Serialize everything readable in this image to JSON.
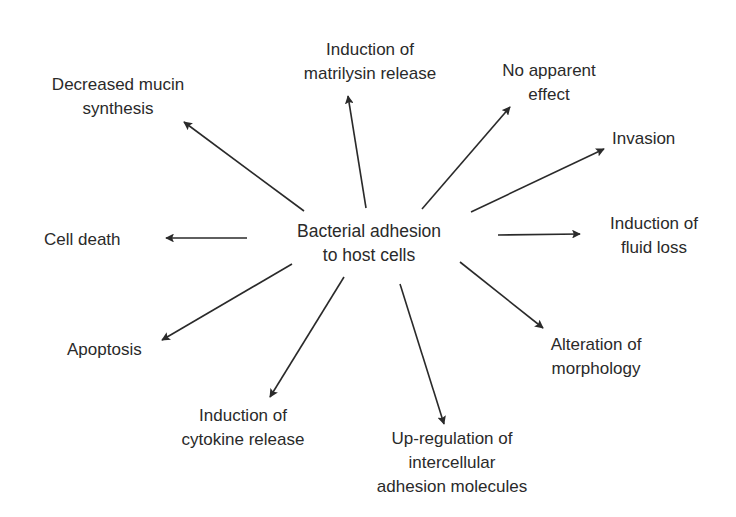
{
  "diagram": {
    "type": "radial-flow",
    "colors": {
      "background": "#ffffff",
      "text": "#2a2a2a",
      "arrow": "#2a2a2a"
    },
    "center": {
      "id": "center",
      "lines": [
        "Bacterial adhesion",
        "to host cells"
      ],
      "x": 369,
      "y": 243
    },
    "outcomes": [
      {
        "id": "decreased-mucin",
        "lines": [
          "Decreased mucin",
          "synthesis"
        ],
        "x": 118,
        "y": 97,
        "align": "center"
      },
      {
        "id": "matrilysin",
        "lines": [
          "Induction of",
          "matrilysin release"
        ],
        "x": 370,
        "y": 62,
        "align": "center"
      },
      {
        "id": "no-effect",
        "lines": [
          "No apparent",
          "effect"
        ],
        "x": 549,
        "y": 83,
        "align": "center"
      },
      {
        "id": "invasion",
        "lines": [
          "Invasion"
        ],
        "x": 612,
        "y": 139,
        "align": "left"
      },
      {
        "id": "fluid-loss",
        "lines": [
          "Induction of",
          "fluid loss"
        ],
        "x": 654,
        "y": 236,
        "align": "center"
      },
      {
        "id": "cell-death",
        "lines": [
          "Cell death"
        ],
        "x": 44,
        "y": 240,
        "align": "left"
      },
      {
        "id": "apoptosis",
        "lines": [
          "Apoptosis"
        ],
        "x": 67,
        "y": 350,
        "align": "left"
      },
      {
        "id": "morphology",
        "lines": [
          "Alteration of",
          "morphology"
        ],
        "x": 596,
        "y": 357,
        "align": "center"
      },
      {
        "id": "cytokine",
        "lines": [
          "Induction of",
          "cytokine release"
        ],
        "x": 243,
        "y": 428,
        "align": "center"
      },
      {
        "id": "adhesion-molecules",
        "lines": [
          "Up-regulation of",
          "intercellular",
          "adhesion molecules"
        ],
        "x": 452,
        "y": 463,
        "align": "center"
      }
    ],
    "edges": [
      {
        "from": "center",
        "to": "decreased-mucin",
        "x1": 304,
        "y1": 211,
        "x2": 184,
        "y2": 122
      },
      {
        "from": "center",
        "to": "matrilysin",
        "x1": 366,
        "y1": 208,
        "x2": 348,
        "y2": 96
      },
      {
        "from": "center",
        "to": "no-effect",
        "x1": 422,
        "y1": 209,
        "x2": 510,
        "y2": 107
      },
      {
        "from": "center",
        "to": "invasion",
        "x1": 471,
        "y1": 212,
        "x2": 604,
        "y2": 149
      },
      {
        "from": "center",
        "to": "fluid-loss",
        "x1": 498,
        "y1": 235,
        "x2": 580,
        "y2": 234
      },
      {
        "from": "center",
        "to": "cell-death",
        "x1": 247,
        "y1": 238,
        "x2": 166,
        "y2": 238
      },
      {
        "from": "center",
        "to": "apoptosis",
        "x1": 292,
        "y1": 264,
        "x2": 162,
        "y2": 340
      },
      {
        "from": "center",
        "to": "morphology",
        "x1": 460,
        "y1": 262,
        "x2": 543,
        "y2": 328
      },
      {
        "from": "center",
        "to": "cytokine",
        "x1": 344,
        "y1": 277,
        "x2": 270,
        "y2": 397
      },
      {
        "from": "center",
        "to": "adhesion-molecules",
        "x1": 400,
        "y1": 284,
        "x2": 444,
        "y2": 424
      }
    ]
  }
}
